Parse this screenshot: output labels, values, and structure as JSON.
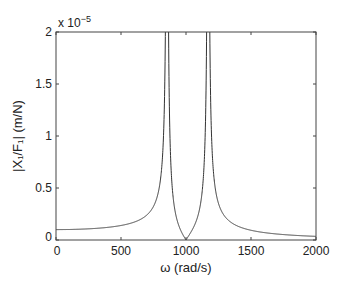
{
  "chart_data": {
    "type": "line",
    "title": "",
    "xlabel": "ω (rad/s)",
    "ylabel": "|X₁/F₁| (m/N)",
    "y_multiplier_label": "x 10",
    "y_multiplier_exponent": "−5",
    "xlim": [
      0,
      2000
    ],
    "ylim": [
      0,
      2
    ],
    "xticks": [
      0,
      500,
      1000,
      1500,
      2000
    ],
    "xtick_labels": [
      "0",
      "500",
      "1000",
      "1500",
      "2000"
    ],
    "yticks": [
      0,
      0.5,
      1,
      1.5,
      2
    ],
    "ytick_labels": [
      "0",
      "0.5",
      "1",
      "1.5",
      "2"
    ],
    "grid": false,
    "legend": null,
    "annotations": {
      "resonance_1_rad_s": 854,
      "antiresonance_rad_s": 1000,
      "resonance_2_rad_s": 1170
    },
    "series": [
      {
        "name": "|X1/F1|",
        "x": [
          0,
          200,
          400,
          600,
          700,
          800,
          830,
          900,
          950,
          1000,
          1050,
          1100,
          1200,
          1250,
          1400,
          1600,
          1800,
          2000
        ],
        "y_e5": [
          0.1,
          0.104,
          0.118,
          0.155,
          0.2,
          0.39,
          0.7,
          0.55,
          0.23,
          0.0,
          0.25,
          0.75,
          0.92,
          0.45,
          0.16,
          0.085,
          0.055,
          0.035
        ]
      }
    ],
    "model": {
      "m1": 1,
      "m2": 0.1,
      "k1": 1000000,
      "k2": 100000
    }
  },
  "colors": {
    "axis": "#333333",
    "line": "#333333",
    "background": "#ffffff"
  }
}
